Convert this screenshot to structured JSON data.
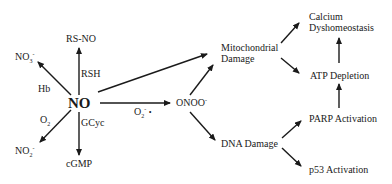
{
  "diagram": {
    "center": "NO",
    "nodes": {
      "rsno": "RS-NO",
      "rsh": "RSH",
      "no3": {
        "base": "NO",
        "sub": "3",
        "sup": "-"
      },
      "hb": "Hb",
      "o2": {
        "base": "O",
        "sub": "2"
      },
      "no2": {
        "base": "NO",
        "sub": "2",
        "sup": "-"
      },
      "gcyc": "GCyc",
      "cgmp": "cGMP",
      "superoxide": {
        "base": "O",
        "sub": "2",
        "sup": "-",
        "dot": "•"
      },
      "onoo": {
        "base": "ONOO",
        "sup": "-"
      },
      "mito": [
        "Mitochondrial",
        "Damage"
      ],
      "dna": "DNA Damage",
      "calcium": [
        "Calcium",
        "Dyshomeostasis"
      ],
      "atp": "ATP Depletion",
      "parp": "PARP Activation",
      "p53": "p53 Activation"
    },
    "edges": [
      {
        "from": "NO",
        "to": "RS-NO",
        "label": "RSH"
      },
      {
        "from": "NO",
        "to": "NO3-",
        "label": "Hb"
      },
      {
        "from": "NO",
        "to": "NO2-",
        "label": "O2"
      },
      {
        "from": "NO",
        "to": "cGMP",
        "label": "GCyc"
      },
      {
        "from": "NO",
        "to": "ONOO-",
        "label": "O2-•"
      },
      {
        "from": "NO",
        "to": "Mitochondrial Damage"
      },
      {
        "from": "ONOO-",
        "to": "Mitochondrial Damage"
      },
      {
        "from": "ONOO-",
        "to": "DNA Damage"
      },
      {
        "from": "Mitochondrial Damage",
        "to": "Calcium Dyshomeostasis"
      },
      {
        "from": "Mitochondrial Damage",
        "to": "ATP Depletion"
      },
      {
        "from": "ATP Depletion",
        "to": "Calcium Dyshomeostasis"
      },
      {
        "from": "PARP Activation",
        "to": "ATP Depletion"
      },
      {
        "from": "DNA Damage",
        "to": "PARP Activation"
      },
      {
        "from": "DNA Damage",
        "to": "p53 Activation"
      }
    ]
  }
}
